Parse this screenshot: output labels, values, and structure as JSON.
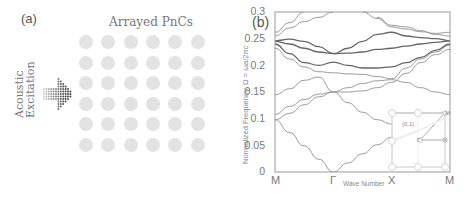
{
  "panel_a": {
    "label": "(a)",
    "title": "Arrayed PnCs",
    "excitation_label_line1": "Acoustic",
    "excitation_label_line2": "Excitation",
    "grid": {
      "rows": 6,
      "cols": 6,
      "x_centers": [
        86,
        108,
        131,
        153,
        175,
        198
      ],
      "y_centers": [
        42,
        63,
        83,
        104,
        124,
        145
      ],
      "radius": 7,
      "color": "#e3e3e3"
    }
  },
  "panel_b": {
    "label": "(b)",
    "ylabel": "Normalized Frequency, Ω = ωa/2πc",
    "xlabel": "Wave Number",
    "yticks": [
      "0.3",
      "0.25",
      "0.2",
      "0.15",
      "0.1",
      "0.05",
      "0"
    ],
    "xticks": [
      "M",
      "Γ",
      "X",
      "M"
    ],
    "inset": {
      "label": "(0,1)",
      "points": [
        "M",
        "Γ",
        "X"
      ]
    }
  },
  "chart_data": {
    "type": "line",
    "title": "",
    "xlabel": "Wave Number",
    "ylabel": "Normalized Frequency, Ω = ωa/2πc",
    "ylim": [
      0,
      0.3
    ],
    "x_ticks": [
      "M",
      "Γ",
      "X",
      "M"
    ],
    "x_positions": [
      0,
      1,
      2,
      3
    ],
    "y_ticks": [
      0,
      0.05,
      0.1,
      0.15,
      0.2,
      0.25,
      0.3
    ],
    "grid": false,
    "x": [
      0,
      0.25,
      0.5,
      0.75,
      1.0,
      1.25,
      1.5,
      1.75,
      2.0,
      2.25,
      2.5,
      2.75,
      3.0
    ],
    "series": [
      {
        "name": "band 1",
        "color": "#999999",
        "values": [
          0.098,
          0.074,
          0.049,
          0.024,
          0.0,
          0.017,
          0.034,
          0.051,
          0.065,
          null,
          null,
          null,
          null
        ]
      },
      {
        "name": "band 2",
        "color": "#999999",
        "values": [
          0.098,
          0.11,
          0.126,
          0.141,
          0.15,
          0.13,
          0.112,
          0.098,
          0.09,
          null,
          null,
          null,
          null
        ]
      },
      {
        "name": "band 3",
        "color": "#999999",
        "values": [
          0.108,
          0.123,
          0.136,
          0.146,
          0.15,
          0.158,
          0.166,
          0.171,
          0.173,
          0.168,
          0.158,
          0.15,
          0.145
        ]
      },
      {
        "name": "band 4",
        "color": "#999999",
        "values": [
          0.145,
          0.156,
          0.172,
          0.178,
          0.15,
          0.15,
          0.152,
          0.158,
          0.168,
          0.185,
          0.205,
          0.22,
          0.23
        ]
      },
      {
        "name": "band 5",
        "color": "#999999",
        "values": [
          0.232,
          0.212,
          0.197,
          0.188,
          0.186,
          0.184,
          0.183,
          0.179,
          0.175,
          0.195,
          0.212,
          0.225,
          0.238
        ]
      },
      {
        "name": "band 6",
        "color": "#666666",
        "values": [
          0.24,
          0.222,
          0.205,
          0.2,
          0.206,
          0.2,
          0.195,
          0.195,
          0.197,
          0.205,
          0.215,
          0.228,
          0.24
        ]
      },
      {
        "name": "band 7",
        "color": "#666666",
        "values": [
          0.245,
          0.24,
          0.232,
          0.225,
          0.222,
          0.223,
          0.225,
          0.23,
          0.232,
          0.236,
          0.24,
          0.243,
          0.246
        ]
      },
      {
        "name": "band 8",
        "color": "#666666",
        "values": [
          0.246,
          0.249,
          0.245,
          0.235,
          0.222,
          0.232,
          0.245,
          0.258,
          0.262,
          0.255,
          0.252,
          0.25,
          0.246
        ]
      },
      {
        "name": "band 9",
        "color": "#999999",
        "values": [
          0.255,
          0.27,
          0.282,
          0.29,
          0.3,
          null,
          null,
          0.29,
          0.275,
          0.272,
          0.265,
          0.258,
          0.255
        ]
      },
      {
        "name": "band 10",
        "color": "#999999",
        "values": [
          0.262,
          0.28,
          0.3,
          null,
          null,
          null,
          0.3,
          0.288,
          0.272,
          0.268,
          0.263,
          0.26,
          0.262
        ]
      }
    ],
    "inset": "first Brillouin zone schematic with points Γ, X, M and lattice label (0,1)"
  }
}
